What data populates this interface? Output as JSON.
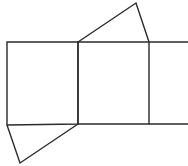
{
  "diagram": {
    "type": "geometric-net",
    "stroke_color": "#2a2a2a",
    "background": "#ffffff",
    "shapes": {
      "left_square": {
        "points": [
          [
            7,
            42
          ],
          [
            78,
            42
          ],
          [
            78,
            124
          ],
          [
            7,
            125
          ]
        ]
      },
      "middle_square": {
        "points": [
          [
            78,
            42
          ],
          [
            149,
            42
          ],
          [
            149,
            124
          ],
          [
            78,
            124
          ]
        ]
      },
      "top_triangle": {
        "points": [
          [
            78,
            42
          ],
          [
            136,
            3
          ],
          [
            149,
            42
          ]
        ]
      },
      "bottom_triangle": {
        "points": [
          [
            7,
            125
          ],
          [
            78,
            124
          ],
          [
            20,
            163
          ]
        ]
      },
      "top_extension": {
        "from": [
          149,
          42
        ],
        "to": [
          188,
          42
        ]
      },
      "bottom_extension": {
        "from": [
          149,
          124
        ],
        "to": [
          188,
          124
        ]
      }
    }
  }
}
